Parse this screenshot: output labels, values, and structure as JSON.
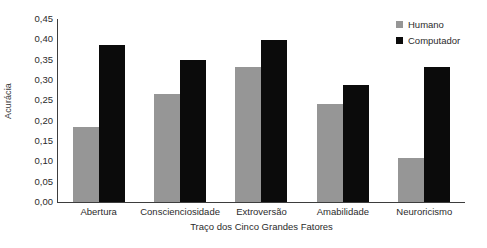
{
  "chart_data": {
    "type": "bar",
    "title": "",
    "subtitle": "",
    "xlabel": "Traço dos Cinco Grandes Fatores",
    "ylabel": "Acurácia",
    "categories": [
      "Abertura",
      "Conscienciosidade",
      "Extroversão",
      "Amabilidade",
      "Neuroricismo"
    ],
    "series": [
      {
        "name": "Humano",
        "color": "#969696",
        "values": [
          0.185,
          0.265,
          0.332,
          0.24,
          0.108
        ]
      },
      {
        "name": "Computador",
        "color": "#0b0b0b",
        "values": [
          0.385,
          0.348,
          0.398,
          0.288,
          0.332
        ]
      }
    ],
    "ylim": [
      0.0,
      0.45
    ],
    "ytick_values": [
      0.0,
      0.05,
      0.1,
      0.15,
      0.2,
      0.25,
      0.3,
      0.35,
      0.4,
      0.45
    ],
    "ytick_labels": [
      "0,00",
      "0,05",
      "0,10",
      "0,15",
      "0,20",
      "0,25",
      "0,30",
      "0,35",
      "0,40",
      "0,45"
    ],
    "grid": false,
    "legend_position": "top-right",
    "decimal_separator": ","
  },
  "legend": {
    "items": [
      {
        "label": "Humano",
        "swatch": "legend-swatch-human"
      },
      {
        "label": "Computador",
        "swatch": "legend-swatch-computer"
      }
    ]
  }
}
